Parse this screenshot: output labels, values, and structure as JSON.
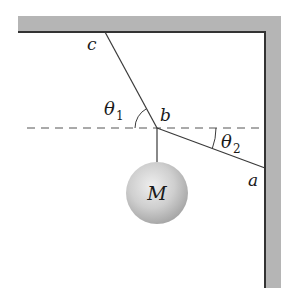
{
  "diagram": {
    "type": "statics-free-body",
    "labels": {
      "point_c": "c",
      "point_b": "b",
      "point_a": "a",
      "mass": "M",
      "theta1_symbol": "θ",
      "theta1_sub": "1",
      "theta2_symbol": "θ",
      "theta2_sub": "2"
    },
    "colors": {
      "wall_fill": "#b5b5b5",
      "wall_edge": "#333333",
      "rope": "#3a3a3a",
      "dashed_line": "#555555",
      "mass_light": "#e6e6e6",
      "mass_dark": "#a9a9a9",
      "text": "#1a1a1a"
    },
    "geometry": {
      "point_b": [
        157,
        128
      ],
      "point_c": [
        105,
        32
      ],
      "point_a": [
        265,
        168
      ],
      "mass_center": [
        157,
        193
      ],
      "mass_radius": 31
    }
  }
}
